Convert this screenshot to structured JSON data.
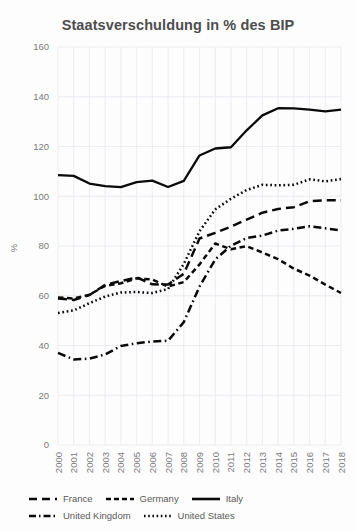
{
  "chart_data": {
    "type": "line",
    "title": "Staatsverschuldung in % des BIP",
    "xlabel": "",
    "ylabel": "%",
    "ylim": [
      0,
      160
    ],
    "yticks": [
      0,
      20,
      40,
      60,
      80,
      100,
      120,
      140,
      160
    ],
    "grid": true,
    "legend_position": "bottom",
    "categories": [
      "2000",
      "2001",
      "2002",
      "2003",
      "2004",
      "2005",
      "2006",
      "2007",
      "2008",
      "2009",
      "2010",
      "2011",
      "2012",
      "2013",
      "2014",
      "2015",
      "2016",
      "2017",
      "2018"
    ],
    "series": [
      {
        "name": "France",
        "dash": "long-dash",
        "values": [
          58.9,
          58.3,
          60.3,
          64.4,
          65.9,
          67.4,
          64.6,
          64.5,
          68.8,
          83.0,
          85.3,
          87.8,
          90.6,
          93.4,
          94.9,
          95.6,
          98.0,
          98.4,
          98.4
        ]
      },
      {
        "name": "Germany",
        "dash": "short-dash",
        "values": [
          59.3,
          58.9,
          60.4,
          64.0,
          65.0,
          67.0,
          66.5,
          63.7,
          65.5,
          72.6,
          81.0,
          78.7,
          79.9,
          77.4,
          74.7,
          70.9,
          68.1,
          64.5,
          61.1
        ]
      },
      {
        "name": "Italy",
        "dash": "solid",
        "values": [
          108.5,
          108.2,
          105.1,
          104.1,
          103.7,
          105.7,
          106.3,
          103.7,
          106.2,
          116.4,
          119.2,
          119.7,
          126.5,
          132.5,
          135.4,
          135.3,
          134.8,
          134.1,
          134.8
        ]
      },
      {
        "name": "United Kingdom",
        "dash": "dash-dot",
        "values": [
          37.0,
          34.4,
          34.7,
          36.4,
          39.8,
          40.9,
          41.6,
          41.9,
          49.4,
          63.7,
          74.6,
          80.1,
          83.2,
          84.2,
          86.2,
          86.9,
          87.9,
          87.1,
          86.3
        ]
      },
      {
        "name": "United States",
        "dash": "dotted",
        "values": [
          53.1,
          54.1,
          57.0,
          59.7,
          61.3,
          61.5,
          61.1,
          62.7,
          72.8,
          85.9,
          94.7,
          99.0,
          102.5,
          104.6,
          104.4,
          104.6,
          106.8,
          106.0,
          106.9
        ]
      }
    ]
  },
  "legend": {
    "items": [
      {
        "label": "France",
        "style": "long-dash"
      },
      {
        "label": "Germany",
        "style": "short-dash"
      },
      {
        "label": "Italy",
        "style": "solid"
      },
      {
        "label": "United Kingdom",
        "style": "dash-dot"
      },
      {
        "label": "United States",
        "style": "dotted"
      }
    ]
  },
  "colors": {
    "line": "#0a0a0a",
    "grid": "#e9e9ef",
    "title": "#4d4d4d",
    "tick": "#7a7a7a",
    "background": "#fdfdfd"
  }
}
